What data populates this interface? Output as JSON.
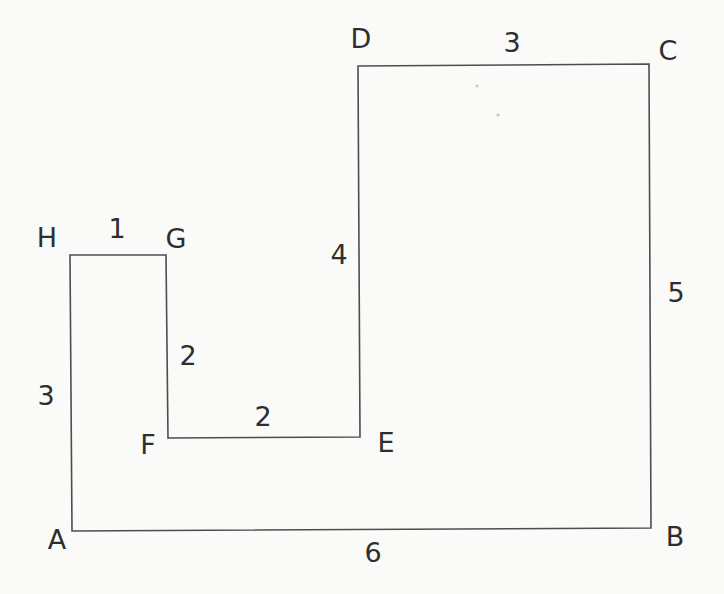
{
  "diagram": {
    "type": "rectilinear-polygon",
    "background_color": "#fafaf8",
    "line_color": "#4d4d4d",
    "text_color": "#2e2e2e",
    "polygon_points": "72,531 651,528 649,64 358,66 360,437 168,438 166,255 70,255",
    "vertex_labels": {
      "A": "A",
      "B": "B",
      "C": "C",
      "D": "D",
      "E": "E",
      "F": "F",
      "G": "G",
      "H": "H"
    },
    "side_labels": {
      "HG": "1",
      "GF": "2",
      "FE": "2",
      "AH": "3",
      "DC": "3",
      "DE": "4",
      "CB": "5",
      "AB": "6"
    },
    "sides": [
      {
        "side": "HG",
        "length": 1
      },
      {
        "side": "GF",
        "length": 2
      },
      {
        "side": "FE",
        "length": 2
      },
      {
        "side": "AH",
        "length": 3
      },
      {
        "side": "DC",
        "length": 3
      },
      {
        "side": "DE",
        "length": 4
      },
      {
        "side": "CB",
        "length": 5
      },
      {
        "side": "AB",
        "length": 6
      }
    ]
  }
}
